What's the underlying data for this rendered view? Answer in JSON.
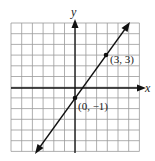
{
  "chart_data": {
    "type": "line",
    "title": "",
    "xlabel": "x",
    "ylabel": "y",
    "xlim": [
      -6,
      6
    ],
    "ylim": [
      -6,
      6
    ],
    "grid": true,
    "legend": null,
    "series": [
      {
        "name": "line",
        "equation": "y = (4/3)x - 1",
        "slope": 1.3333,
        "intercept": -1,
        "x": [
          -3.5,
          4.8
        ],
        "y": [
          -5.667,
          5.4
        ]
      }
    ],
    "points": [
      {
        "x": 3,
        "y": 3,
        "label": "(3, 3)"
      },
      {
        "x": 0,
        "y": -1,
        "label": "(0, −1)"
      }
    ],
    "annotations": [
      "(3, 3)",
      "(0, −1)"
    ]
  },
  "labels": {
    "x_axis": "x",
    "y_axis": "y",
    "point_a": "(3, 3)",
    "point_b": "(0, −1)"
  },
  "colors": {
    "grid": "#9a9a9a",
    "axis": "#111111",
    "line": "#111111"
  }
}
